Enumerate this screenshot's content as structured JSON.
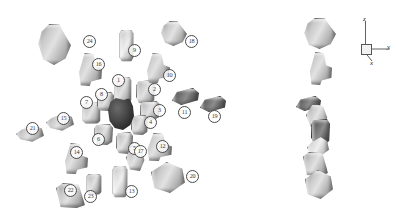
{
  "figure": {
    "background_color": "#ffffff",
    "left_panel": {
      "name": "exploded-view",
      "parts": [
        {
          "id": "1",
          "label": "1",
          "x": 114,
          "y": 76,
          "w": 16,
          "h": 26,
          "shape": "cl-cyl",
          "tone": "",
          "lx": 112,
          "ly": 74
        },
        {
          "id": "2",
          "label": "2",
          "x": 136,
          "y": 80,
          "w": 17,
          "h": 22,
          "shape": "cl-box",
          "tone": "",
          "lx": 148,
          "ly": 83
        },
        {
          "id": "3",
          "label": "3",
          "x": 140,
          "y": 101,
          "w": 18,
          "h": 17,
          "shape": "cl-box",
          "tone": "",
          "lx": 153,
          "ly": 104
        },
        {
          "id": "4",
          "label": "4",
          "x": 131,
          "y": 115,
          "w": 15,
          "h": 18,
          "shape": "cl-box",
          "tone": "",
          "lx": 144,
          "ly": 116
        },
        {
          "id": "5",
          "label": "5",
          "x": 116,
          "y": 132,
          "w": 15,
          "h": 20,
          "shape": "cl-box",
          "tone": "",
          "lx": 128,
          "ly": 142
        },
        {
          "id": "6",
          "label": "6",
          "x": 94,
          "y": 124,
          "w": 17,
          "h": 19,
          "shape": "cl-box",
          "tone": "",
          "lx": 92,
          "ly": 133
        },
        {
          "id": "7",
          "label": "7",
          "x": 82,
          "y": 101,
          "w": 17,
          "h": 21,
          "shape": "cl-cyl",
          "tone": "",
          "lx": 80,
          "ly": 96
        },
        {
          "id": "8",
          "label": "8",
          "x": 97,
          "y": 92,
          "w": 15,
          "h": 17,
          "shape": "cl-box",
          "tone": "",
          "lx": 95,
          "ly": 88
        },
        {
          "id": "9",
          "label": "9",
          "x": 119,
          "y": 29,
          "w": 13,
          "h": 31,
          "shape": "cl-cyl",
          "tone": "light",
          "lx": 128,
          "ly": 44
        },
        {
          "id": "10",
          "label": "10",
          "x": 142,
          "y": 53,
          "w": 26,
          "h": 28,
          "shape": "cl-tee",
          "tone": "",
          "lx": 163,
          "ly": 69
        },
        {
          "id": "11",
          "label": "11",
          "x": 172,
          "y": 88,
          "w": 25,
          "h": 15,
          "shape": "cl-slab",
          "tone": "dark",
          "lx": 178,
          "ly": 106
        },
        {
          "id": "12",
          "label": "12",
          "x": 142,
          "y": 133,
          "w": 28,
          "h": 26,
          "shape": "cl-tee",
          "tone": "",
          "lx": 156,
          "ly": 140
        },
        {
          "id": "13",
          "label": "13",
          "x": 112,
          "y": 165,
          "w": 14,
          "h": 31,
          "shape": "cl-cyl",
          "tone": "light",
          "lx": 125,
          "ly": 185
        },
        {
          "id": "14",
          "label": "14",
          "x": 60,
          "y": 143,
          "w": 26,
          "h": 29,
          "shape": "cl-tee",
          "tone": "",
          "lx": 70,
          "ly": 146
        },
        {
          "id": "15",
          "label": "15",
          "x": 46,
          "y": 112,
          "w": 26,
          "h": 18,
          "shape": "cl-lens",
          "tone": "",
          "lx": 57,
          "ly": 112
        },
        {
          "id": "16",
          "label": "16",
          "x": 74,
          "y": 53,
          "w": 26,
          "h": 31,
          "shape": "cl-tee",
          "tone": "",
          "lx": 92,
          "ly": 58
        },
        {
          "id": "17",
          "label": "17",
          "x": 126,
          "y": 146,
          "w": 18,
          "h": 23,
          "shape": "cl-wedge",
          "tone": "",
          "lx": 134,
          "ly": 145
        },
        {
          "id": "18",
          "label": "18",
          "x": 160,
          "y": 21,
          "w": 25,
          "h": 23,
          "shape": "cl-knob",
          "tone": "",
          "lx": 185,
          "ly": 35
        },
        {
          "id": "19",
          "label": "19",
          "x": 200,
          "y": 96,
          "w": 24,
          "h": 14,
          "shape": "cl-slab",
          "tone": "dark",
          "lx": 208,
          "ly": 110
        },
        {
          "id": "20",
          "label": "20",
          "x": 151,
          "y": 162,
          "w": 32,
          "h": 29,
          "shape": "cl-pent",
          "tone": "",
          "lx": 186,
          "ly": 170
        },
        {
          "id": "21",
          "label": "21",
          "x": 16,
          "y": 124,
          "w": 26,
          "h": 17,
          "shape": "cl-lens",
          "tone": "",
          "lx": 26,
          "ly": 122
        },
        {
          "id": "22",
          "label": "22",
          "x": 56,
          "y": 183,
          "w": 27,
          "h": 23,
          "shape": "cl-trap",
          "tone": "",
          "lx": 64,
          "ly": 184
        },
        {
          "id": "23",
          "label": "23",
          "x": 86,
          "y": 173,
          "w": 14,
          "h": 20,
          "shape": "cl-cyl",
          "tone": "",
          "lx": 84,
          "ly": 190
        },
        {
          "id": "24",
          "label": "24",
          "x": 37,
          "y": 24,
          "w": 32,
          "h": 39,
          "shape": "cl-knob",
          "tone": "",
          "lx": 83,
          "ly": 35
        }
      ],
      "core_cluster": {
        "name": "dark-core-cluster",
        "x": 108,
        "y": 98,
        "w": 26,
        "h": 32
      }
    },
    "right_panel": {
      "name": "assembled-stack",
      "parts": [
        {
          "x": 303,
          "y": 18,
          "w": 31,
          "h": 29,
          "shape": "cl-knob",
          "tone": ""
        },
        {
          "x": 305,
          "y": 52,
          "w": 25,
          "h": 31,
          "shape": "cl-tee",
          "tone": ""
        },
        {
          "x": 296,
          "y": 96,
          "w": 23,
          "h": 13,
          "shape": "cl-slab",
          "tone": "dark"
        },
        {
          "x": 306,
          "y": 104,
          "w": 21,
          "h": 22,
          "shape": "cl-wedge",
          "tone": ""
        },
        {
          "x": 311,
          "y": 119,
          "w": 17,
          "h": 24,
          "shape": "cl-box",
          "tone": "dark"
        },
        {
          "x": 307,
          "y": 136,
          "w": 20,
          "h": 20,
          "shape": "cl-lens",
          "tone": "light"
        },
        {
          "x": 303,
          "y": 152,
          "w": 23,
          "h": 22,
          "shape": "cl-trap",
          "tone": ""
        },
        {
          "x": 305,
          "y": 170,
          "w": 26,
          "h": 27,
          "shape": "cl-pent",
          "tone": ""
        }
      ]
    },
    "axis_indicator": {
      "name": "axis-indicator",
      "z_label": "z",
      "y_label": "y",
      "x_label": "x"
    },
    "header_text": "",
    "caption_text": ""
  }
}
